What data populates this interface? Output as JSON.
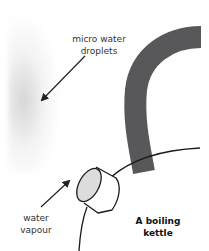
{
  "diagram": {
    "labels": {
      "droplets_line1": "micro water",
      "droplets_line2": "droplets",
      "vapour_line1": "water",
      "vapour_line2": "vapour",
      "kettle_line1": "A boiling",
      "kettle_line2": "kettle"
    },
    "colors": {
      "handle": "#58585a",
      "outline": "#1a1a1a",
      "spout_face": "#dcdcdc",
      "mist": "#c8c8c8",
      "arrow": "#222222"
    }
  }
}
